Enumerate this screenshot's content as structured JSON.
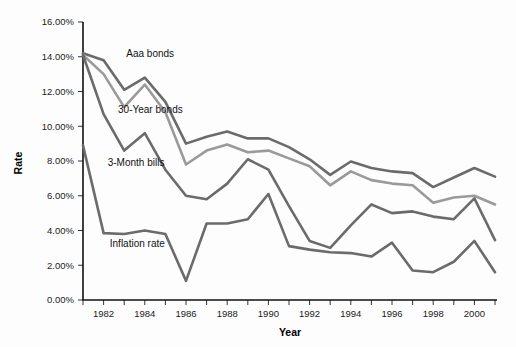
{
  "chart_data": {
    "type": "line",
    "title": "",
    "xlabel": "Year",
    "ylabel": "Rate",
    "xlim": [
      1981,
      2001
    ],
    "ylim": [
      0,
      16
    ],
    "ytick_step": 2,
    "grid": false,
    "legend_position": "inline-annotations",
    "ytick_labels": [
      "0.00%",
      "2.00%",
      "4.00%",
      "6.00%",
      "8.00%",
      "10.00%",
      "12.00%",
      "14.00%",
      "16.00%"
    ],
    "ytick_values": [
      0,
      2,
      4,
      6,
      8,
      10,
      12,
      14,
      16
    ],
    "xtick_values": [
      1981,
      1982,
      1983,
      1984,
      1985,
      1986,
      1987,
      1988,
      1989,
      1990,
      1991,
      1992,
      1993,
      1994,
      1995,
      1996,
      1997,
      1998,
      1999,
      2000,
      2001
    ],
    "xtick_labels": [
      "1982",
      "1984",
      "1986",
      "1988",
      "1990",
      "1992",
      "1994",
      "1996",
      "1998",
      "2000"
    ],
    "xtick_label_values": [
      1982,
      1984,
      1986,
      1988,
      1990,
      1992,
      1994,
      1996,
      1998,
      2000
    ],
    "x": [
      1981,
      1982,
      1983,
      1984,
      1985,
      1986,
      1987,
      1988,
      1989,
      1990,
      1991,
      1992,
      1993,
      1994,
      1995,
      1996,
      1997,
      1998,
      1999,
      2000,
      2001
    ],
    "series": [
      {
        "name": "Aaa bonds",
        "color": "#6b6b6b",
        "label_x": 1983.1,
        "label_y": 14.0,
        "values": [
          14.2,
          13.8,
          12.1,
          12.8,
          11.4,
          9.0,
          9.4,
          9.7,
          9.3,
          9.3,
          8.8,
          8.1,
          7.2,
          7.97,
          7.6,
          7.4,
          7.3,
          6.5,
          7.05,
          7.6,
          7.1
        ]
      },
      {
        "name": "30-Year bonds",
        "color": "#9a9a9a",
        "label_x": 1982.7,
        "label_y": 10.75,
        "values": [
          14.1,
          13.0,
          11.1,
          12.4,
          10.8,
          7.8,
          8.6,
          8.95,
          8.5,
          8.6,
          8.15,
          7.7,
          6.6,
          7.4,
          6.9,
          6.7,
          6.6,
          5.6,
          5.9,
          6.0,
          5.5
        ]
      },
      {
        "name": "3-Month bills",
        "color": "#6b6b6b",
        "label_x": 1982.2,
        "label_y": 7.7,
        "values": [
          14.1,
          10.7,
          8.6,
          9.6,
          7.5,
          6.0,
          5.8,
          6.7,
          8.1,
          7.5,
          5.4,
          3.4,
          3.0,
          4.3,
          5.5,
          5.0,
          5.1,
          4.8,
          4.65,
          5.85,
          3.45
        ]
      },
      {
        "name": "Inflation rate",
        "color": "#6b6b6b",
        "label_x": 1982.3,
        "label_y": 3.05,
        "values": [
          8.9,
          3.85,
          3.8,
          4.0,
          3.8,
          1.1,
          4.4,
          4.4,
          4.65,
          6.1,
          3.1,
          2.9,
          2.75,
          2.7,
          2.5,
          3.3,
          1.7,
          1.6,
          2.2,
          3.4,
          1.6
        ]
      }
    ]
  }
}
